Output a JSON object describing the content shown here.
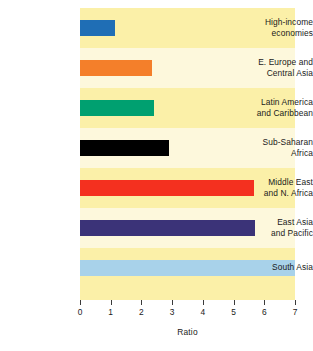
{
  "chart_data": {
    "type": "bar",
    "orientation": "horizontal",
    "title": "",
    "xlabel": "Ratio",
    "ylabel": "",
    "xlim": [
      0,
      7
    ],
    "ylim": null,
    "grid": false,
    "legend": null,
    "xticks": [
      "0",
      "1",
      "2",
      "3",
      "4",
      "5",
      "6",
      "7"
    ],
    "xtick_values": [
      0,
      1,
      2,
      3,
      4,
      5,
      6,
      7
    ],
    "categories": [
      "High-income economies",
      "E. Europe and Central Asia",
      "Latin America and Caribbean",
      "Sub-Saharan Africa",
      "Middle East and N. Africa",
      "East Asia and Pacific",
      "South Asia"
    ],
    "values": [
      1.15,
      2.35,
      2.4,
      2.9,
      5.65,
      5.7,
      7.0
    ],
    "bars": [
      {
        "label_line1": "High-income",
        "label_line2": "economies",
        "value": 1.15,
        "color": "#1f6eb5"
      },
      {
        "label_line1": "E. Europe and",
        "label_line2": "Central Asia",
        "value": 2.35,
        "color": "#f47f2a"
      },
      {
        "label_line1": "Latin America",
        "label_line2": "and Caribbean",
        "value": 2.4,
        "color": "#00a070"
      },
      {
        "label_line1": "Sub-Saharan",
        "label_line2": "Africa",
        "value": 2.9,
        "color": "#000000"
      },
      {
        "label_line1": "Middle East",
        "label_line2": "and N. Africa",
        "value": 5.65,
        "color": "#f4301f"
      },
      {
        "label_line1": "East Asia",
        "label_line2": "and Pacific",
        "value": 5.7,
        "color": "#3b3378"
      },
      {
        "label_line1": "South Asia",
        "label_line2": "",
        "value": 7.0,
        "color": "#a8d2ea"
      }
    ],
    "plot_background_bands": [
      "#fbf0a8",
      "#fdf8dc",
      "#fbf0a8",
      "#fdf8dc",
      "#fbf0a8",
      "#fdf8dc",
      "#fbf0a8"
    ],
    "plot_background_color": "#fbf0a8",
    "axis_tick_color": "#3a3a3a",
    "text_color": "#1a1a1a"
  }
}
